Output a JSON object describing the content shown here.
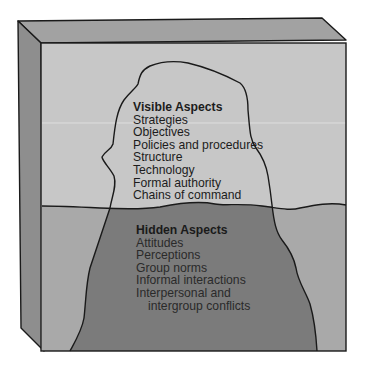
{
  "diagram": {
    "type": "iceberg",
    "colors": {
      "background": "#ffffff",
      "box_top_face": "#a2a2a2",
      "box_left_face": "#8e8e8e",
      "sky": "#c7c7c7",
      "water": "#a9a9a9",
      "iceberg_above": "#c7c7c7",
      "iceberg_below": "#7b7b7b",
      "outline": "#1a1a1a"
    },
    "visible_aspects": {
      "title": "Visible Aspects",
      "items": [
        "Strategies",
        "Objectives",
        "Policies and procedures",
        "Structure",
        "Technology",
        "Formal authority",
        "Chains of command"
      ]
    },
    "hidden_aspects": {
      "title": "Hidden Aspects",
      "items": [
        "Attitudes",
        "Perceptions",
        "Group norms",
        "Informal interactions",
        "Interpersonal and"
      ],
      "continuation": "intergroup conflicts"
    }
  }
}
